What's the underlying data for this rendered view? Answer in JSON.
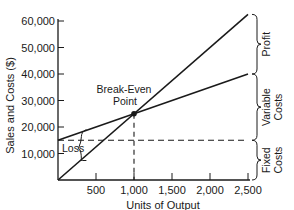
{
  "chart_data": {
    "type": "line",
    "title": "",
    "xlabel": "Units of Output",
    "ylabel": "Sales and Costs ($)",
    "xlim": [
      0,
      2500
    ],
    "ylim": [
      0,
      60000
    ],
    "x_ticks": [
      500,
      1000,
      1500,
      2000,
      2500
    ],
    "x_tick_labels": [
      "500",
      "1,000",
      "1,500",
      "2,000",
      "2,500"
    ],
    "y_ticks": [
      10000,
      20000,
      30000,
      40000,
      50000,
      60000
    ],
    "y_tick_labels": [
      "10,000",
      "20,000",
      "30,000",
      "40,000",
      "50,000",
      "60,000"
    ],
    "grid": false,
    "series": [
      {
        "name": "Sales Revenue",
        "x": [
          0,
          2500
        ],
        "values": [
          0,
          62500
        ],
        "style": "solid"
      },
      {
        "name": "Total Costs",
        "x": [
          0,
          2500
        ],
        "values": [
          15000,
          40000
        ],
        "style": "solid"
      },
      {
        "name": "Fixed Costs",
        "x": [
          0,
          2500
        ],
        "values": [
          15000,
          15000
        ],
        "style": "dashed"
      }
    ],
    "break_even": {
      "label_line1": "Break-Even",
      "label_line2": "Point",
      "units": 1000,
      "value": 25000
    },
    "annotations": {
      "loss": "Loss",
      "profit": "Profit",
      "variable_costs_line1": "Variable",
      "variable_costs_line2": "Costs",
      "fixed_costs_line1": "Fixed",
      "fixed_costs_line2": "Costs"
    }
  }
}
